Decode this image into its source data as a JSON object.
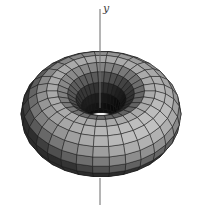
{
  "figure": {
    "name": "torus-about-y-axis",
    "background": "#ffffff",
    "axis": {
      "label": "y",
      "label_color": "#3f3f3f",
      "color": "#6a6a6a",
      "stroke_width": 1,
      "x": 100,
      "top": 9,
      "hole_end": 108,
      "re_emerge": 178,
      "bottom": 205
    },
    "torus": {
      "center_x": 101,
      "center_y": 114,
      "ring_radius": 49,
      "tube_radius": 31,
      "elevation_deg": 41,
      "u_segments": 30,
      "v_segments": 18
    },
    "shading": {
      "light": [
        0.38,
        0.84,
        0.39
      ],
      "ambient": 44,
      "diffuse": 150,
      "inner_shadow": 0.8,
      "mesh_stroke": "#1b1b1b",
      "mesh_stroke_width": 0.55,
      "mesh_stroke_opacity": 0.85
    }
  }
}
